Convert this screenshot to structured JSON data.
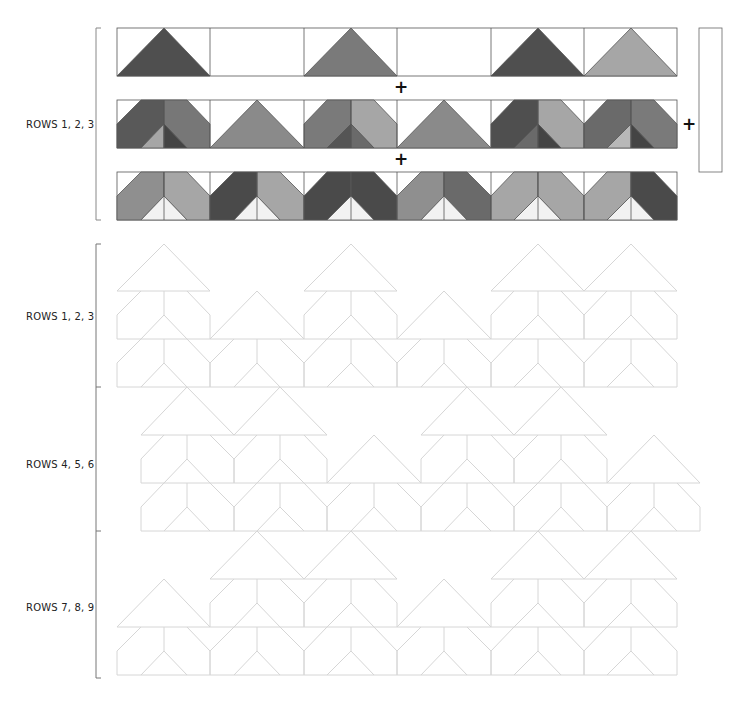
{
  "labels": {
    "top_section": "ROWS 1, 2, 3",
    "bottom_section_1": "ROWS 1, 2, 3",
    "bottom_section_2": "ROWS 4, 5, 6",
    "bottom_section_3": "ROWS 7, 8, 9"
  },
  "plus_signs": [
    "+",
    "+",
    "+"
  ],
  "colors": {
    "dark": "#4f4f4f",
    "medium": "#7a7a7a",
    "light": "#a6a6a6",
    "pale": "#dcdcdc",
    "outline": "#d8d8d8",
    "stroke": "#555555",
    "background": "#ffffff"
  },
  "top_strips": {
    "strip_1_triangles": [
      "dark",
      "none",
      "medium",
      "none",
      "dark",
      "light"
    ],
    "strip_2_blocks": [
      "chevron-dark/medium",
      "triangle-medium",
      "chevron-medium/light",
      "triangle-medium",
      "chevron-dark/light",
      "chevron-medium/medium"
    ],
    "strip_3_blocks": [
      "light/light",
      "dark/light",
      "dark/dark",
      "medium/medium",
      "light/light",
      "light/dark"
    ]
  }
}
